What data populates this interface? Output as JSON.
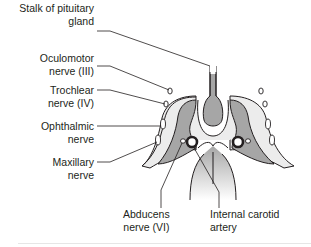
{
  "figure": {
    "colors": {
      "outline": "#231f20",
      "dark_fill": "#a6a6a6",
      "light_fill": "#ececec",
      "white": "#ffffff"
    },
    "labels": [
      {
        "id": "stalk",
        "line1": "Stalk of pituitary",
        "line2": "gland"
      },
      {
        "id": "oculomotor",
        "line1": "Oculomotor",
        "line2": "nerve (III)"
      },
      {
        "id": "trochlear",
        "line1": "Trochlear",
        "line2": "nerve (IV)"
      },
      {
        "id": "ophthalmic",
        "line1": "Ophthalmic",
        "line2": "nerve"
      },
      {
        "id": "maxillary",
        "line1": "Maxillary",
        "line2": "nerve"
      },
      {
        "id": "abducens",
        "line1": "Abducens",
        "line2": "nerve (VI)"
      },
      {
        "id": "carotid",
        "line1": "Internal carotid",
        "line2": "artery"
      }
    ]
  }
}
